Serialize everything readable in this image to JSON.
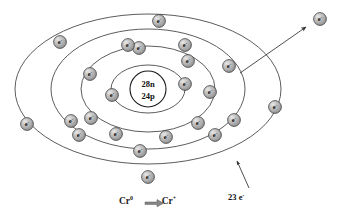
{
  "figure": {
    "type": "atomic-shell-diagram",
    "background_color": "#ffffff",
    "line_color": "#4a4a4a",
    "electron_fill": "#b0b0b0"
  },
  "nucleus": {
    "neutrons_label": "28n",
    "protons_label": "24p",
    "cx": 148,
    "cy": 89,
    "r": 18
  },
  "shells": [
    {
      "name": "shell-1",
      "rx": 37,
      "ry": 24,
      "electron_count": 2
    },
    {
      "name": "shell-2",
      "rx": 67,
      "ry": 43,
      "electron_count": 8
    },
    {
      "name": "shell-3",
      "rx": 97,
      "ry": 60,
      "electron_count": 8
    },
    {
      "name": "shell-4",
      "rx": 133,
      "ry": 75,
      "electron_count": 5
    }
  ],
  "electrons": {
    "glyph": "e",
    "charge": "-",
    "positions": [
      {
        "id": "e1",
        "shell": 1,
        "x": 112,
        "y": 95
      },
      {
        "id": "e2",
        "shell": 1,
        "x": 185,
        "y": 84
      },
      {
        "id": "e3",
        "shell": 2,
        "x": 139,
        "y": 48
      },
      {
        "id": "e4",
        "shell": 2,
        "x": 188,
        "y": 61
      },
      {
        "id": "e5",
        "shell": 2,
        "x": 210,
        "y": 92
      },
      {
        "id": "e6",
        "shell": 2,
        "x": 198,
        "y": 123
      },
      {
        "id": "e7",
        "shell": 2,
        "x": 166,
        "y": 137
      },
      {
        "id": "e8",
        "shell": 2,
        "x": 116,
        "y": 134
      },
      {
        "id": "e9",
        "shell": 2,
        "x": 91,
        "y": 118
      },
      {
        "id": "e10",
        "shell": 2,
        "x": 90,
        "y": 74
      },
      {
        "id": "e11",
        "shell": 3,
        "x": 128,
        "y": 45
      },
      {
        "id": "e12",
        "shell": 3,
        "x": 185,
        "y": 45
      },
      {
        "id": "e13",
        "shell": 3,
        "x": 229,
        "y": 66
      },
      {
        "id": "e14",
        "shell": 3,
        "x": 234,
        "y": 120
      },
      {
        "id": "e15",
        "shell": 3,
        "x": 215,
        "y": 135
      },
      {
        "id": "e16",
        "shell": 3,
        "x": 140,
        "y": 151
      },
      {
        "id": "e17",
        "shell": 3,
        "x": 79,
        "y": 135
      },
      {
        "id": "e18",
        "shell": 3,
        "x": 71,
        "y": 121
      },
      {
        "id": "e19",
        "shell": 4,
        "x": 159,
        "y": 21
      },
      {
        "id": "e20",
        "shell": 4,
        "x": 60,
        "y": 42
      },
      {
        "id": "e21",
        "shell": 4,
        "x": 27,
        "y": 124
      },
      {
        "id": "e22",
        "shell": 4,
        "x": 148,
        "y": 177
      },
      {
        "id": "e23",
        "shell": 4,
        "x": 275,
        "y": 107
      }
    ],
    "escaped": {
      "id": "e-escaped",
      "x": 320,
      "y": 19
    }
  },
  "ejection_arrow": {
    "from_x": 240,
    "from_y": 73,
    "to_x": 308,
    "to_y": 26
  },
  "annotation": {
    "count_label": "23",
    "unit_label": "e",
    "unit_charge": "-",
    "leader_from_x": 248,
    "leader_from_y": 189,
    "leader_to_x": 236,
    "leader_to_y": 160
  },
  "caption": {
    "left_symbol": "Cr",
    "left_charge": "0",
    "arrow": "⟹",
    "right_symbol": "Cr",
    "right_charge": "+",
    "full_text": "Cr0 ⟹ Cr+"
  }
}
